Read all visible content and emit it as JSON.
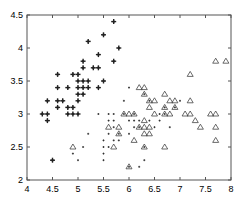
{
  "chart_data": {
    "type": "scatter",
    "title": "",
    "xlabel": "",
    "ylabel": "",
    "xlim": [
      4,
      8
    ],
    "ylim": [
      2,
      4.5
    ],
    "grid": false,
    "legend": null,
    "xticks": [
      "4",
      "4.5",
      "5",
      "5.5",
      "6",
      "6.5",
      "7",
      "7.5",
      "8"
    ],
    "yticks": [
      "2",
      "2.5",
      "3",
      "3.5",
      "4",
      "4.5"
    ],
    "series": [
      {
        "name": "class-1",
        "marker": "bold-plus",
        "points": [
          [
            4.3,
            3.0
          ],
          [
            4.4,
            2.9
          ],
          [
            4.4,
            3.0
          ],
          [
            4.4,
            3.2
          ],
          [
            4.5,
            2.3
          ],
          [
            4.6,
            3.1
          ],
          [
            4.6,
            3.2
          ],
          [
            4.6,
            3.4
          ],
          [
            4.6,
            3.6
          ],
          [
            4.7,
            3.2
          ],
          [
            4.8,
            3.0
          ],
          [
            4.8,
            3.1
          ],
          [
            4.8,
            3.4
          ],
          [
            4.9,
            3.0
          ],
          [
            4.9,
            3.1
          ],
          [
            4.9,
            3.6
          ],
          [
            5.0,
            3.0
          ],
          [
            5.0,
            3.2
          ],
          [
            5.0,
            3.3
          ],
          [
            5.0,
            3.4
          ],
          [
            5.0,
            3.5
          ],
          [
            5.0,
            3.6
          ],
          [
            5.1,
            3.3
          ],
          [
            5.1,
            3.4
          ],
          [
            5.1,
            3.5
          ],
          [
            5.1,
            3.7
          ],
          [
            5.1,
            3.8
          ],
          [
            5.2,
            3.4
          ],
          [
            5.2,
            3.5
          ],
          [
            5.2,
            4.1
          ],
          [
            5.3,
            3.7
          ],
          [
            5.4,
            3.4
          ],
          [
            5.4,
            3.7
          ],
          [
            5.4,
            3.9
          ],
          [
            5.5,
            3.5
          ],
          [
            5.5,
            4.2
          ],
          [
            5.7,
            3.8
          ],
          [
            5.7,
            4.4
          ],
          [
            5.8,
            4.0
          ]
        ]
      },
      {
        "name": "class-2",
        "marker": "small-dot",
        "points": [
          [
            4.9,
            2.4
          ],
          [
            5.0,
            2.3
          ],
          [
            5.2,
            2.7
          ],
          [
            5.4,
            3.0
          ],
          [
            5.5,
            2.3
          ],
          [
            5.5,
            2.4
          ],
          [
            5.5,
            2.5
          ],
          [
            5.5,
            2.6
          ],
          [
            5.6,
            2.5
          ],
          [
            5.6,
            2.7
          ],
          [
            5.6,
            2.9
          ],
          [
            5.6,
            3.0
          ],
          [
            5.7,
            2.6
          ],
          [
            5.7,
            2.8
          ],
          [
            5.7,
            2.9
          ],
          [
            5.7,
            3.0
          ],
          [
            5.8,
            2.6
          ],
          [
            5.8,
            2.7
          ],
          [
            5.9,
            3.0
          ],
          [
            5.9,
            3.2
          ],
          [
            6.0,
            2.2
          ],
          [
            6.0,
            2.7
          ],
          [
            6.0,
            2.9
          ],
          [
            6.0,
            3.4
          ],
          [
            6.1,
            2.8
          ],
          [
            6.1,
            2.9
          ],
          [
            6.1,
            3.0
          ],
          [
            6.2,
            2.2
          ],
          [
            6.2,
            2.9
          ],
          [
            6.3,
            2.3
          ],
          [
            6.3,
            2.5
          ],
          [
            6.3,
            3.3
          ],
          [
            6.4,
            2.9
          ],
          [
            6.4,
            3.2
          ],
          [
            6.5,
            2.8
          ],
          [
            6.6,
            2.9
          ],
          [
            6.6,
            3.0
          ],
          [
            6.7,
            3.0
          ],
          [
            6.7,
            3.1
          ],
          [
            6.8,
            2.8
          ],
          [
            6.9,
            3.1
          ],
          [
            7.0,
            3.2
          ],
          [
            5.1,
            2.5
          ],
          [
            6.2,
            2.8
          ]
        ]
      },
      {
        "name": "class-3",
        "marker": "open-triangle",
        "points": [
          [
            4.9,
            2.5
          ],
          [
            5.6,
            2.8
          ],
          [
            5.7,
            2.5
          ],
          [
            5.8,
            2.7
          ],
          [
            5.8,
            2.8
          ],
          [
            5.9,
            3.0
          ],
          [
            6.0,
            2.2
          ],
          [
            6.0,
            3.0
          ],
          [
            6.1,
            2.6
          ],
          [
            6.1,
            3.0
          ],
          [
            6.2,
            2.8
          ],
          [
            6.2,
            3.4
          ],
          [
            6.3,
            2.5
          ],
          [
            6.3,
            2.7
          ],
          [
            6.3,
            2.8
          ],
          [
            6.3,
            2.9
          ],
          [
            6.3,
            3.3
          ],
          [
            6.3,
            3.4
          ],
          [
            6.4,
            2.7
          ],
          [
            6.4,
            2.8
          ],
          [
            6.4,
            3.1
          ],
          [
            6.4,
            3.2
          ],
          [
            6.5,
            3.0
          ],
          [
            6.5,
            3.2
          ],
          [
            6.7,
            2.5
          ],
          [
            6.7,
            3.0
          ],
          [
            6.7,
            3.1
          ],
          [
            6.7,
            3.3
          ],
          [
            6.8,
            3.0
          ],
          [
            6.8,
            3.2
          ],
          [
            6.9,
            3.1
          ],
          [
            6.9,
            3.2
          ],
          [
            7.1,
            3.0
          ],
          [
            7.2,
            3.0
          ],
          [
            7.2,
            3.2
          ],
          [
            7.2,
            3.6
          ],
          [
            7.3,
            2.9
          ],
          [
            7.4,
            2.8
          ],
          [
            7.6,
            3.0
          ],
          [
            7.7,
            2.6
          ],
          [
            7.7,
            2.8
          ],
          [
            7.7,
            3.0
          ],
          [
            7.7,
            3.8
          ],
          [
            7.9,
            3.8
          ]
        ]
      }
    ]
  },
  "colors": {
    "axis": "#555555",
    "marker": "#222222",
    "background": "#ffffff"
  }
}
